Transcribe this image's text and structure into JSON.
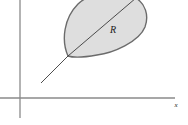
{
  "figure": {
    "kind": "shaded-region-diagram",
    "background_color": "#ffffff",
    "region": {
      "label": "R",
      "label_position": {
        "x": 113,
        "y": 33
      },
      "fill_color": "#dedede",
      "stroke_color": "#6b6b6b",
      "stroke_width": 1.4,
      "description": "leaf-shaped shaded region with cusp at lower left",
      "cusp": {
        "x": 68,
        "y": 56
      },
      "path": "M 68 56 C 61 40 64 18 78 4 C 90 -8 118 -10 134 -3 C 146 3 149 16 145 27 C 139 42 113 53 97 55 C 86 57 74 58 68 56 Z"
    },
    "chord": {
      "name": "diagonal-chord",
      "stroke_color": "#3a3a3a",
      "stroke_width": 0.9,
      "from": {
        "x": 68,
        "y": 56
      },
      "to": {
        "x": 136,
        "y": -2
      }
    },
    "ray": {
      "name": "lower-left-ray",
      "stroke_color": "#3a3a3a",
      "stroke_width": 0.9,
      "from": {
        "x": 68,
        "y": 56
      },
      "to": {
        "x": 41,
        "y": 83
      }
    },
    "axes": {
      "color": "#8a8a8a",
      "stroke_width": 1.3,
      "x_axis": {
        "label": "x",
        "label_position": {
          "x": 176,
          "y": 107
        },
        "from": {
          "x": 0,
          "y": 98
        },
        "to": {
          "x": 175,
          "y": 98
        }
      },
      "y_axis": {
        "label": "",
        "from": {
          "x": 20,
          "y": 0
        },
        "to": {
          "x": 20,
          "y": 118
        }
      }
    }
  }
}
